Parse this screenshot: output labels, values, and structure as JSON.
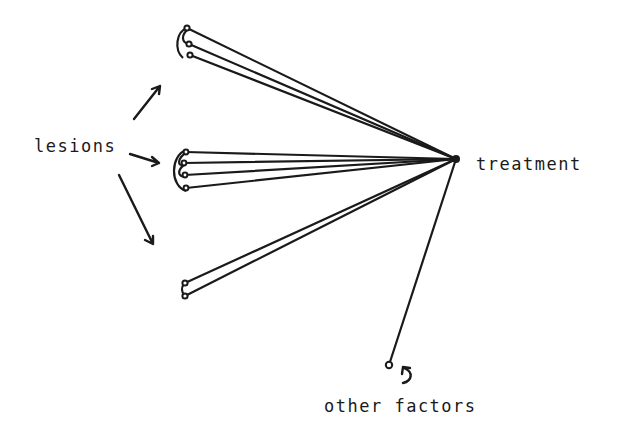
{
  "diagram": {
    "type": "hand-drawn network/path diagram",
    "labels": {
      "lesions": "lesions",
      "treatment": "treatment",
      "other_factors": "other factors"
    },
    "colors": {
      "ink": "#1a1a1a",
      "background": "#ffffff"
    },
    "hub": {
      "name": "treatment",
      "x": 456,
      "y": 159
    },
    "lesion_groups": [
      {
        "name": "top-group",
        "nodes": [
          {
            "x": 187,
            "y": 28
          },
          {
            "x": 189,
            "y": 44
          },
          {
            "x": 190,
            "y": 55
          }
        ]
      },
      {
        "name": "middle-group",
        "nodes": [
          {
            "x": 186,
            "y": 152
          },
          {
            "x": 184,
            "y": 163
          },
          {
            "x": 185,
            "y": 175
          },
          {
            "x": 186,
            "y": 188
          }
        ]
      },
      {
        "name": "bottom-group",
        "nodes": [
          {
            "x": 185,
            "y": 283
          },
          {
            "x": 185,
            "y": 296
          }
        ]
      }
    ],
    "other_factors_node": {
      "x": 389,
      "y": 365
    }
  }
}
